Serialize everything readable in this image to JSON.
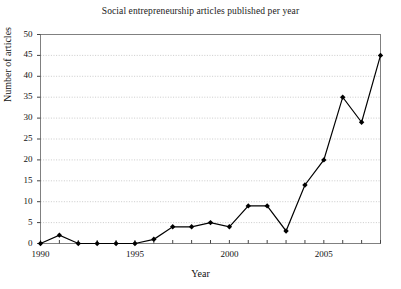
{
  "chart_data": {
    "type": "line",
    "title": "Social entrepreneurship articles published per year",
    "xlabel": "Year",
    "ylabel": "Number of articles",
    "x": [
      1990,
      1991,
      1992,
      1993,
      1994,
      1995,
      1996,
      1997,
      1998,
      1999,
      2000,
      2001,
      2002,
      2003,
      2004,
      2005,
      2006,
      2007,
      2008
    ],
    "values": [
      0,
      2,
      0,
      0,
      0,
      0,
      1,
      4,
      4,
      5,
      4,
      9,
      9,
      3,
      14,
      20,
      35,
      29,
      45
    ],
    "xlim": [
      1990,
      2008
    ],
    "ylim": [
      0,
      50
    ],
    "ytick_values": [
      0,
      5,
      10,
      15,
      20,
      25,
      30,
      35,
      40,
      45,
      50
    ],
    "ytick_labels": [
      "0",
      "5",
      "10",
      "15",
      "20",
      "25",
      "30",
      "35",
      "40",
      "45",
      "50"
    ],
    "xtick_values": [
      1990,
      1995,
      2000,
      2005
    ],
    "xtick_labels": [
      "1990",
      "1995",
      "2000",
      "2005"
    ],
    "xminor_tick_values": [
      1990,
      1991,
      1992,
      1993,
      1994,
      1995,
      1996,
      1997,
      1998,
      1999,
      2000,
      2001,
      2002,
      2003,
      2004,
      2005,
      2006,
      2007,
      2008
    ],
    "grid": "horizontal-dotted",
    "legend": "none",
    "marker": "diamond",
    "series_color": "#000000",
    "grid_color": "#b4b4b4",
    "frame_color": "#808080"
  }
}
